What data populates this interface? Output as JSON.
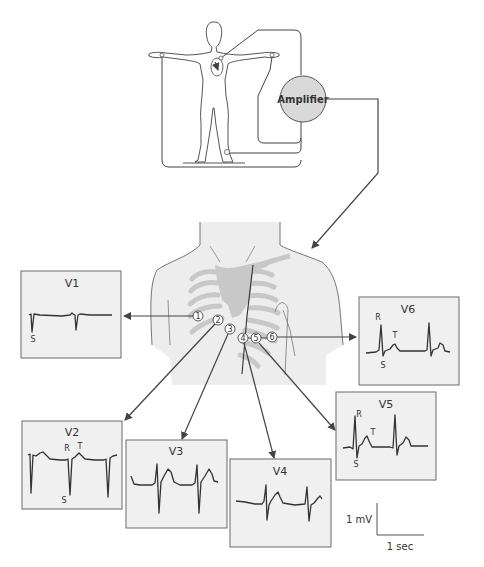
{
  "figure": {
    "amplifier_label": "Amplifier",
    "electrodes": [
      "1",
      "2",
      "3",
      "4",
      "5",
      "6"
    ],
    "leads": [
      {
        "id": "V1",
        "label": "V1",
        "waves": {
          "S": "S"
        }
      },
      {
        "id": "V2",
        "label": "V2",
        "waves": {
          "R": "R",
          "T": "T",
          "S": "S"
        }
      },
      {
        "id": "V3",
        "label": "V3",
        "waves": {}
      },
      {
        "id": "V4",
        "label": "V4",
        "waves": {}
      },
      {
        "id": "V5",
        "label": "V5",
        "waves": {
          "R": "R",
          "T": "T",
          "S": "S"
        }
      },
      {
        "id": "V6",
        "label": "V6",
        "waves": {
          "R": "R",
          "T": "T",
          "S": "S"
        }
      }
    ],
    "scale_bar": {
      "voltage_label": "1 mV",
      "time_label": "1 sec"
    }
  },
  "colors": {
    "box_fill": "#f0f0f0",
    "box_stroke": "#6a6a6a",
    "amplifier_fill": "#d9d9d9",
    "body_fill": "#efefef",
    "rib_fill": "#c8c8c8",
    "line": "#444444"
  }
}
